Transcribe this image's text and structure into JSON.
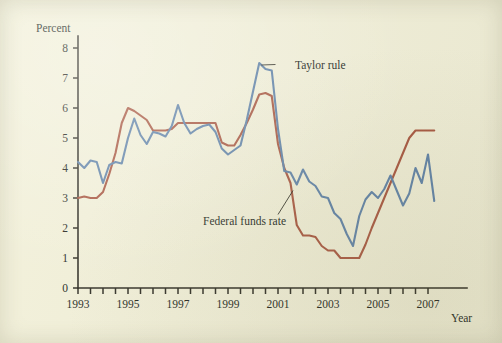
{
  "figure": {
    "background_color": "#f2f0d8",
    "ink_color": "#201f18"
  },
  "chart_data": {
    "type": "line",
    "title": "",
    "subtitle": "",
    "xlabel": "Year",
    "ylabel": "Percent",
    "xlim": [
      1993,
      2007.5
    ],
    "ylim": [
      0,
      8.4
    ],
    "grid": false,
    "legend_position": "inline-annotations",
    "y_ticks": [
      0,
      1,
      2,
      3,
      4,
      5,
      6,
      7,
      8
    ],
    "y_tick_labels": [
      "0",
      "1",
      "2",
      "3",
      "4",
      "5",
      "6",
      "7",
      "8"
    ],
    "x_ticks": [
      1993,
      1993.5,
      1994,
      1994.5,
      1995,
      1995.5,
      1996,
      1996.5,
      1997,
      1997.5,
      1998,
      1998.5,
      1999,
      1999.5,
      2000,
      2000.5,
      2001,
      2001.5,
      2002,
      2002.5,
      2003,
      2003.5,
      2004,
      2004.5,
      2005,
      2005.5,
      2006,
      2006.5,
      2007
    ],
    "x_tick_labels": [
      {
        "x": 1993,
        "label": "1993"
      },
      {
        "x": 1995,
        "label": "1995"
      },
      {
        "x": 1997,
        "label": "1997"
      },
      {
        "x": 1999,
        "label": "1999"
      },
      {
        "x": 2001,
        "label": "2001"
      },
      {
        "x": 2003,
        "label": "2003"
      },
      {
        "x": 2005,
        "label": "2005"
      },
      {
        "x": 2007,
        "label": "2007"
      }
    ],
    "annotations": [
      {
        "name": "taylor-rule-label",
        "text": "Taylor rule",
        "x": 2000.9,
        "y": 7.45
      },
      {
        "name": "federal-funds-rate-label",
        "text": "Federal funds rate",
        "x": 1996.6,
        "y": 2.1
      }
    ],
    "series": [
      {
        "name": "Taylor rule",
        "color": "#5f82a8",
        "x": [
          1993.0,
          1993.25,
          1993.5,
          1993.75,
          1994.0,
          1994.25,
          1994.5,
          1994.75,
          1995.0,
          1995.25,
          1995.5,
          1995.75,
          1996.0,
          1996.25,
          1996.5,
          1996.75,
          1997.0,
          1997.25,
          1997.5,
          1997.75,
          1998.0,
          1998.25,
          1998.5,
          1998.75,
          1999.0,
          1999.25,
          1999.5,
          1999.75,
          2000.0,
          2000.25,
          2000.5,
          2000.75,
          2001.0,
          2001.25,
          2001.5,
          2001.75,
          2002.0,
          2002.25,
          2002.5,
          2002.75,
          2003.0,
          2003.25,
          2003.5,
          2003.75,
          2004.0,
          2004.25,
          2004.5,
          2004.75,
          2005.0,
          2005.25,
          2005.5,
          2005.75,
          2006.0,
          2006.25,
          2006.5,
          2006.75,
          2007.0,
          2007.25
        ],
        "values": [
          4.2,
          4.0,
          4.25,
          4.2,
          3.5,
          4.1,
          4.2,
          4.15,
          5.0,
          5.65,
          5.1,
          4.8,
          5.2,
          5.15,
          5.05,
          5.4,
          6.1,
          5.5,
          5.15,
          5.3,
          5.4,
          5.45,
          5.2,
          4.65,
          4.45,
          4.6,
          4.75,
          5.6,
          6.55,
          7.5,
          7.3,
          7.25,
          5.3,
          3.9,
          3.85,
          3.45,
          3.95,
          3.55,
          3.4,
          3.05,
          3.0,
          2.5,
          2.3,
          1.8,
          1.4,
          2.4,
          2.95,
          3.2,
          3.0,
          3.3,
          3.75,
          3.25,
          2.75,
          3.15,
          4.0,
          3.5,
          4.45,
          2.9
        ]
      },
      {
        "name": "Federal funds rate",
        "color": "#a8563f",
        "x": [
          1993.0,
          1993.25,
          1993.5,
          1993.75,
          1994.0,
          1994.25,
          1994.5,
          1994.75,
          1995.0,
          1995.25,
          1995.5,
          1995.75,
          1996.0,
          1996.25,
          1996.5,
          1996.75,
          1997.0,
          1997.25,
          1997.5,
          1997.75,
          1998.0,
          1998.25,
          1998.5,
          1998.75,
          1999.0,
          1999.25,
          1999.5,
          1999.75,
          2000.0,
          2000.25,
          2000.5,
          2000.75,
          2001.0,
          2001.25,
          2001.5,
          2001.75,
          2002.0,
          2002.25,
          2002.5,
          2002.75,
          2003.0,
          2003.25,
          2003.5,
          2003.75,
          2004.0,
          2004.25,
          2004.5,
          2004.75,
          2005.0,
          2005.25,
          2005.5,
          2005.75,
          2006.0,
          2006.25,
          2006.5,
          2006.75,
          2007.0,
          2007.25
        ],
        "values": [
          3.0,
          3.05,
          3.0,
          3.0,
          3.2,
          3.8,
          4.5,
          5.5,
          6.0,
          5.9,
          5.75,
          5.6,
          5.25,
          5.25,
          5.25,
          5.3,
          5.5,
          5.5,
          5.5,
          5.5,
          5.5,
          5.5,
          5.5,
          4.85,
          4.75,
          4.75,
          5.1,
          5.5,
          5.95,
          6.45,
          6.5,
          6.4,
          4.8,
          4.0,
          3.5,
          2.1,
          1.75,
          1.75,
          1.7,
          1.4,
          1.25,
          1.25,
          1.0,
          1.0,
          1.0,
          1.0,
          1.45,
          2.0,
          2.5,
          3.0,
          3.5,
          4.0,
          4.5,
          5.0,
          5.25,
          5.25,
          5.25,
          5.25
        ]
      }
    ]
  }
}
